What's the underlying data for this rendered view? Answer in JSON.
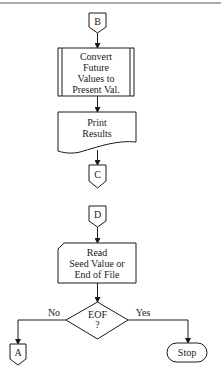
{
  "diagram": {
    "type": "flowchart",
    "connectors": {
      "b": {
        "label": "B"
      },
      "c": {
        "label": "C"
      },
      "d": {
        "label": "D"
      },
      "a": {
        "label": "A"
      }
    },
    "process": {
      "lines": [
        "Convert",
        "Future",
        "Values to",
        "Present Val."
      ]
    },
    "print": {
      "lines": [
        "Print",
        "Results"
      ]
    },
    "read": {
      "lines": [
        "Read",
        "Seed Value or",
        "End of File"
      ]
    },
    "decision": {
      "lines": [
        "EOF",
        "?"
      ],
      "no_label": "No",
      "yes_label": "Yes"
    },
    "terminator": {
      "label": "Stop"
    }
  }
}
